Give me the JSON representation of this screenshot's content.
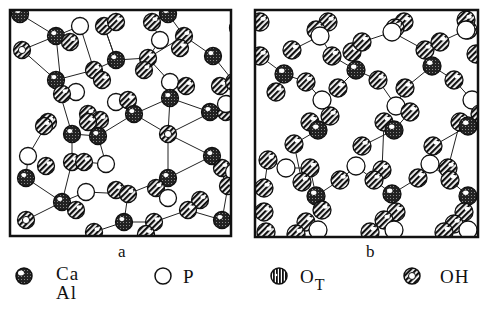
{
  "figure": {
    "panels": [
      {
        "label": "a",
        "description": "disordered network structure (glass)"
      },
      {
        "label": "b",
        "description": "ordered chain structure (crystal)"
      }
    ],
    "legend": [
      {
        "symbol": "cross-hatched-dark-sphere-icon",
        "label_line1": "Ca",
        "label_line2": "Al"
      },
      {
        "symbol": "open-circle-icon",
        "label": "P"
      },
      {
        "symbol": "vertical-striped-sphere-icon",
        "label": "O",
        "subscript": "T"
      },
      {
        "symbol": "ring-hatched-sphere-icon",
        "label": "OH"
      }
    ],
    "colors": {
      "ink": "#111111",
      "paper": "#ffffff"
    }
  }
}
